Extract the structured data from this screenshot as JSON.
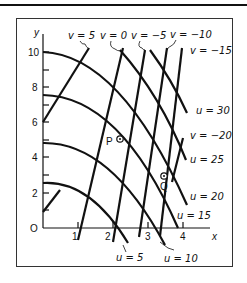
{
  "diagram": {
    "axes": {
      "x_label": "x",
      "y_label": "y",
      "origin_label": "O",
      "x_ticks": [
        "1",
        "2",
        "3",
        "4"
      ],
      "y_ticks": [
        "2",
        "4",
        "6",
        "8",
        "10"
      ]
    },
    "v_labels": [
      "v = 5",
      "v = 0",
      "v = −5",
      "v = −10",
      "v = −15",
      "v = −20"
    ],
    "u_labels": [
      "u = 5",
      "u = 10",
      "u = 15",
      "u = 20",
      "u = 25",
      "u = 30"
    ],
    "points": [
      {
        "label": "P"
      },
      {
        "label": "Q"
      }
    ],
    "colors": {
      "line": "#111111",
      "background": "#ffffff"
    }
  }
}
